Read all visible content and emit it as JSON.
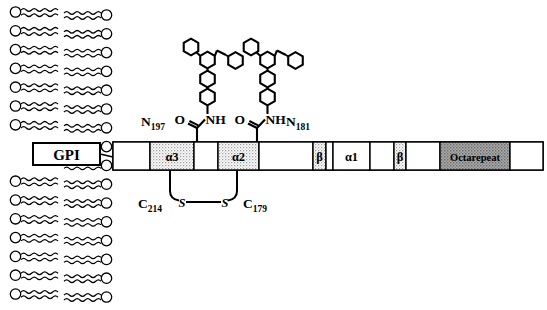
{
  "figure": {
    "background_color": "#ffffff",
    "line_color": "#000000",
    "shade_light": "#d9d9d9",
    "shade_dark": "#9a9a9a"
  },
  "membrane": {
    "name": "lipid-bilayer",
    "leaflet_count": 2,
    "lipids_per_leaflet": 16,
    "head_shape": "circle",
    "tail_shape": "wavy-line",
    "x_left": 10,
    "x_right": 112,
    "y_top": 6,
    "y_bottom": 304
  },
  "gpi": {
    "label": "GPI",
    "x": 33,
    "y": 143,
    "w": 67,
    "h": 22
  },
  "protein_bar": {
    "name": "prion-protein-bar",
    "x": 113,
    "y": 142,
    "w": 430,
    "h": 28,
    "domains": [
      {
        "label": "",
        "x": 113,
        "w": 37,
        "fill": "none",
        "name": "segment-c-terminal"
      },
      {
        "label": "α3",
        "x": 150,
        "w": 44,
        "fill": "light",
        "name": "domain-alpha3"
      },
      {
        "label": "",
        "x": 194,
        "w": 24,
        "fill": "none",
        "name": "segment-linker-1"
      },
      {
        "label": "α2",
        "x": 218,
        "w": 41,
        "fill": "light",
        "name": "domain-alpha2"
      },
      {
        "label": "",
        "x": 259,
        "w": 54,
        "fill": "none",
        "name": "segment-linker-2"
      },
      {
        "label": "β",
        "x": 313,
        "w": 13,
        "fill": "light",
        "name": "domain-beta-2"
      },
      {
        "label": "",
        "x": 326,
        "w": 7,
        "fill": "none",
        "name": "segment-linker-3"
      },
      {
        "label": "α1",
        "x": 333,
        "w": 37,
        "fill": "none",
        "name": "domain-alpha1"
      },
      {
        "label": "",
        "x": 370,
        "w": 24,
        "fill": "none",
        "name": "segment-linker-4"
      },
      {
        "label": "β",
        "x": 394,
        "w": 12,
        "fill": "light",
        "name": "domain-beta-1"
      },
      {
        "label": "",
        "x": 406,
        "w": 34,
        "fill": "none",
        "name": "segment-linker-5"
      },
      {
        "label": "Octarepeat",
        "x": 440,
        "w": 70,
        "fill": "dark",
        "name": "domain-octarepeat"
      },
      {
        "label": "",
        "x": 510,
        "w": 33,
        "fill": "none",
        "name": "segment-n-terminal"
      }
    ]
  },
  "glycosylation": {
    "sites": [
      {
        "name": "glycan-site-n197",
        "asn_label": "N",
        "asn_sub": "197",
        "carbonyl": "O",
        "amide": "NH",
        "stem_x": 197
      },
      {
        "name": "glycan-site-n181",
        "asn_label": "N",
        "asn_sub": "181",
        "carbonyl": "O",
        "amide": "NH",
        "stem_x": 257
      }
    ],
    "dendrimer_rings": 6,
    "ring_type": "benzene-hexagon"
  },
  "disulfide": {
    "name": "disulfide-bond",
    "left_label": "C",
    "left_sub": "214",
    "right_label": "C",
    "right_sub": "179",
    "sulfur_left": "S",
    "sulfur_right": "S",
    "left_anchor_x": 170,
    "right_anchor_x": 237,
    "bottom_y": 200
  }
}
